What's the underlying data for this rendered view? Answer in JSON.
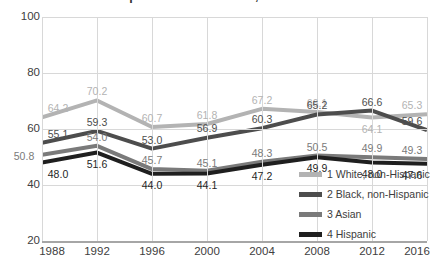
{
  "chart_data": {
    "type": "line",
    "title": "Voter turnout rates in presidential elections, 1988-2016",
    "xlabel": "",
    "ylabel": "",
    "ylim": [
      20,
      100
    ],
    "yticks": [
      "20",
      "40",
      "60",
      "80",
      "100"
    ],
    "grid": true,
    "legend_position": "bottom-right",
    "categories": [
      "1988",
      "1992",
      "1996",
      "2000",
      "2004",
      "2008",
      "2012",
      "2016"
    ],
    "series": [
      {
        "name": "1 White, non-Hispanic",
        "color": "#b3b3b3",
        "values": [
          64.2,
          70.2,
          60.7,
          61.8,
          67.2,
          66.1,
          64.1,
          65.3
        ],
        "labels": [
          "64.2",
          "70.2",
          "60.7",
          "61.8",
          "67.2",
          "66.1",
          "64.1",
          "65.3"
        ]
      },
      {
        "name": "2 Black, non-Hispanic",
        "color": "#4d4d4d",
        "values": [
          55.1,
          59.3,
          53.0,
          56.9,
          60.3,
          65.2,
          66.6,
          59.6
        ],
        "labels": [
          "55.1",
          "59.3",
          "53.0",
          "56.9",
          "60.3",
          "65.2",
          "66.6",
          "59.6"
        ]
      },
      {
        "name": "3 Asian",
        "color": "#7a7a7a",
        "values": [
          50.8,
          54.0,
          45.7,
          45.1,
          48.3,
          50.5,
          49.9,
          49.3
        ],
        "labels": [
          "50.8",
          "54.0",
          "45.7",
          "45.1",
          "48.3",
          "50.5",
          "49.9",
          "49.3"
        ]
      },
      {
        "name": "4 Hispanic",
        "color": "#1f1f1f",
        "values": [
          48.0,
          51.6,
          44.0,
          44.1,
          47.2,
          49.9,
          48.0,
          47.6
        ],
        "labels": [
          "48.0",
          "51.6",
          "44.0",
          "44.1",
          "47.2",
          "49.9",
          "48.0",
          "47.6"
        ]
      }
    ]
  },
  "legend": {
    "items": [
      {
        "label": "1 White, non-Hispanic",
        "color": "#b3b3b3"
      },
      {
        "label": "2 Black, non-Hispanic",
        "color": "#4d4d4d"
      },
      {
        "label": "3 Asian",
        "color": "#7a7a7a"
      },
      {
        "label": "4 Hispanic",
        "color": "#1f1f1f"
      }
    ]
  },
  "colors": {
    "gridline": "#d8d8d8",
    "axis": "#a6a6a6",
    "text": "#3d3d3d",
    "background": "#ffffff"
  }
}
